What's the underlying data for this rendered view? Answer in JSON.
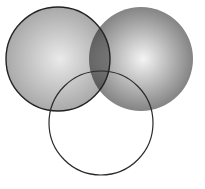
{
  "diagram": {
    "type": "venn",
    "set_count": 3,
    "background": "#ffffff",
    "circles": [
      {
        "id": "left",
        "cx": 58,
        "cy": 59,
        "r": 52,
        "fill": "shaded-gray",
        "gradient_center": "#e6e6e6",
        "gradient_edge": "#9a9a9a",
        "opacity": 0.85,
        "outline": true,
        "stroke": "#222222",
        "stroke_width": 1.4
      },
      {
        "id": "right",
        "cx": 141,
        "cy": 59,
        "r": 52,
        "fill": "shaded-gray",
        "gradient_center": "#f2f2f2",
        "gradient_edge": "#6e6e6e",
        "opacity": 0.85,
        "outline": false
      },
      {
        "id": "bottom",
        "cx": 101,
        "cy": 123,
        "r": 52,
        "fill": "none",
        "outline": true,
        "stroke": "#2a2a2a",
        "stroke_width": 1.2
      }
    ]
  }
}
